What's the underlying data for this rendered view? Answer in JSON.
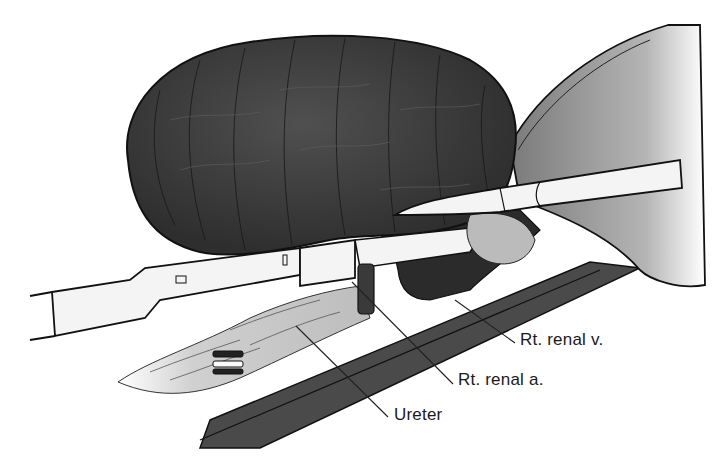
{
  "figure": {
    "colors": {
      "kidney": "#3f3f3f",
      "kidney_dark": "#262626",
      "retroperitoneum": "#4a4a4a",
      "liver": "#9a9a9a",
      "instrument": "#f2f2f2",
      "outline": "#111111",
      "fat": "#d8d8d8"
    }
  },
  "labels": [
    {
      "id": "renal-vein",
      "text": "Rt. renal v.",
      "x": 520,
      "y": 338
    },
    {
      "id": "renal-artery",
      "text": "Rt. renal a.",
      "x": 458,
      "y": 378
    },
    {
      "id": "ureter",
      "text": "Ureter",
      "x": 394,
      "y": 411
    }
  ],
  "leader_lines": [
    {
      "id": "renal-vein-line",
      "x1": 515,
      "y1": 343,
      "x2": 455,
      "y2": 300
    },
    {
      "id": "renal-artery-line",
      "x1": 453,
      "y1": 384,
      "x2": 352,
      "y2": 282
    },
    {
      "id": "ureter-line",
      "x1": 388,
      "y1": 417,
      "x2": 296,
      "y2": 326
    }
  ]
}
